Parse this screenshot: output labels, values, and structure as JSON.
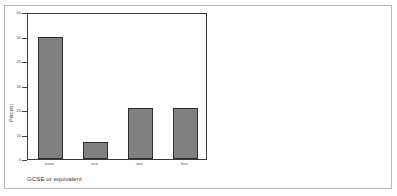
{
  "chart_data": {
    "type": "bar",
    "title": "",
    "xlabel": "GCSE or equivalent",
    "ylabel": "Percent",
    "categories": [
      "none",
      "one",
      "two",
      "four"
    ],
    "values": [
      50,
      7,
      21,
      21
    ],
    "ylim": [
      0,
      60
    ],
    "yticks": [
      "0",
      "10",
      "20",
      "30",
      "40",
      "50",
      "60"
    ],
    "ytick_values": [
      0,
      10,
      20,
      30,
      40,
      50,
      60
    ],
    "grid": false,
    "legend": "none",
    "bar_color": "#808080",
    "bar_edge_color": "#2e2e2e",
    "axis_color": "#3a3a3a",
    "background": "#ffffff",
    "frame_color": "#b9b9b9"
  }
}
